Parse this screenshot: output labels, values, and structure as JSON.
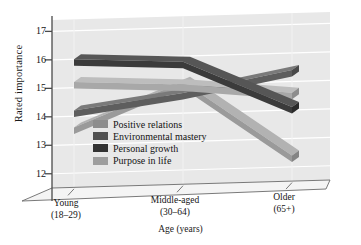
{
  "chart_data": {
    "type": "line",
    "title": "",
    "subtitle": "",
    "xlabel": "Age (years)",
    "ylabel": "Rated importance",
    "categories": [
      "Young\n(18–29)",
      "Middle-aged\n(30–64)",
      "Older\n(65+)"
    ],
    "category_labels": [
      {
        "line1": "Young",
        "line2": "(18–29)"
      },
      {
        "line1": "Middle-aged",
        "line2": "(30–64)"
      },
      {
        "line1": "Older",
        "line2": "(65+)"
      }
    ],
    "yticks": [
      17,
      16,
      15,
      14,
      13,
      12
    ],
    "ylim": [
      11.5,
      17.4
    ],
    "grid": true,
    "legend_position": "inside-lower-left",
    "style": "3d-ribbon",
    "series": [
      {
        "name": "Positive relations",
        "values": [
          15.2,
          15.0,
          14.6
        ],
        "color": "#a8a8a8",
        "side_color": "#8d8d8d",
        "top_color": "#bdbdbd"
      },
      {
        "name": "Environmental mastery",
        "values": [
          14.2,
          14.7,
          15.4
        ],
        "color": "#5e5e5e",
        "side_color": "#4a4a4a",
        "top_color": "#7a7a7a"
      },
      {
        "name": "Personal growth",
        "values": [
          16.0,
          15.8,
          14.1
        ],
        "color": "#3b3b3b",
        "side_color": "#2b2b2b",
        "top_color": "#565656"
      },
      {
        "name": "Purpose in life",
        "values": [
          13.6,
          15.1,
          12.4
        ],
        "color": "#9a9a9a",
        "side_color": "#848484",
        "top_color": "#b2b2b2"
      }
    ],
    "plot_background": "#e8e8e8",
    "gridline_color": "#ffffff",
    "axis_color": "#4a4a4a"
  },
  "legend": {
    "items": [
      {
        "label": "Positive relations",
        "swatch": "#8d8d8d"
      },
      {
        "label": "Environmental mastery",
        "swatch": "#515151"
      },
      {
        "label": "Personal growth",
        "swatch": "#333333"
      },
      {
        "label": "Purpose in life",
        "swatch": "#9e9e9e"
      }
    ]
  }
}
